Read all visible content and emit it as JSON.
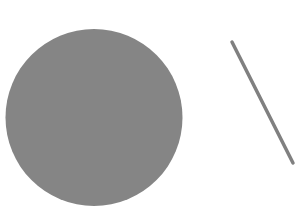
{
  "canvas": {
    "width": 306,
    "height": 214,
    "background": "#ffffff"
  },
  "shapes": {
    "circle": {
      "cx": 94,
      "cy": 117.5,
      "r": 88.5,
      "fill": "#858585"
    },
    "line": {
      "x1": 232,
      "y1": 42,
      "x2": 293,
      "y2": 163,
      "stroke": "#808080",
      "stroke_width": 3.5
    }
  }
}
